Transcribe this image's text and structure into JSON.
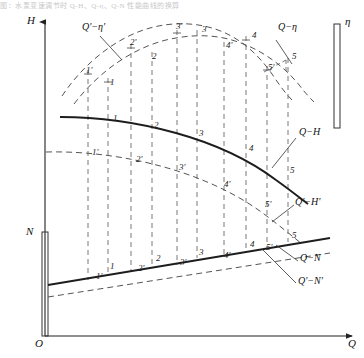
{
  "figure": {
    "title_strip": "图：水泵变速调节时 Q-H、Q-η、Q-N 性能曲线的换算",
    "background": "#ffffff",
    "line_color": "#222222",
    "dashed_color": "#5a5a5a"
  },
  "axes": {
    "y_head": {
      "label": "H",
      "name": "head-axis"
    },
    "y_efficiency": {
      "label": "η",
      "name": "efficiency-axis"
    },
    "y_power": {
      "label": "N",
      "name": "power-axis"
    },
    "x_flow": {
      "label": "Q",
      "name": "flow-axis"
    },
    "origin": {
      "label": "O"
    }
  },
  "curves": {
    "eta_original": {
      "label": "Q−η",
      "style": "dashed"
    },
    "eta_converted": {
      "label": "Q'−η'",
      "style": "dashed"
    },
    "head_original": {
      "label": "Q−H",
      "style": "solid"
    },
    "head_converted": {
      "label": "Q'−H'",
      "style": "dashed"
    },
    "power_original": {
      "label": "Q−N",
      "style": "solid"
    },
    "power_converted": {
      "label": "Q'−N'",
      "style": "dashed"
    }
  },
  "points": {
    "primary": [
      "1",
      "2",
      "3",
      "4",
      "5"
    ],
    "converted": [
      "1'",
      "2'",
      "3'",
      "4'",
      "5'"
    ]
  },
  "point_labels": {
    "eta_top": [
      {
        "text": "1'",
        "x": 86,
        "y": 66
      },
      {
        "text": "1",
        "x": 110,
        "y": 78
      },
      {
        "text": "2'",
        "x": 130,
        "y": 38
      },
      {
        "text": "2",
        "x": 152,
        "y": 52
      },
      {
        "text": "3'",
        "x": 176,
        "y": 22
      },
      {
        "text": "3",
        "x": 202,
        "y": 25
      },
      {
        "text": "4'",
        "x": 226,
        "y": 41
      },
      {
        "text": "4",
        "x": 252,
        "y": 31
      },
      {
        "text": "5'",
        "x": 268,
        "y": 63
      },
      {
        "text": "5",
        "x": 292,
        "y": 52
      }
    ],
    "head_mid": [
      {
        "text": "1",
        "x": 113,
        "y": 114
      },
      {
        "text": "2",
        "x": 154,
        "y": 121
      },
      {
        "text": "3",
        "x": 199,
        "y": 129
      },
      {
        "text": "4",
        "x": 249,
        "y": 144
      },
      {
        "text": "5",
        "x": 290,
        "y": 166
      },
      {
        "text": "1'",
        "x": 92,
        "y": 148
      },
      {
        "text": "2'",
        "x": 136,
        "y": 155
      },
      {
        "text": "3'",
        "x": 179,
        "y": 163
      },
      {
        "text": "4'",
        "x": 224,
        "y": 180
      },
      {
        "text": "5'",
        "x": 265,
        "y": 200
      }
    ],
    "power_bottom": [
      {
        "text": "1",
        "x": 110,
        "y": 262
      },
      {
        "text": "2",
        "x": 156,
        "y": 254
      },
      {
        "text": "3",
        "x": 199,
        "y": 248
      },
      {
        "text": "4",
        "x": 250,
        "y": 240
      },
      {
        "text": "5",
        "x": 292,
        "y": 231
      },
      {
        "text": "1'",
        "x": 96,
        "y": 272
      },
      {
        "text": "2'",
        "x": 138,
        "y": 264
      },
      {
        "text": "3'",
        "x": 180,
        "y": 258
      },
      {
        "text": "4'",
        "x": 224,
        "y": 251
      },
      {
        "text": "5'",
        "x": 266,
        "y": 243
      }
    ]
  },
  "curve_label_positions": {
    "eta_converted": {
      "x": 82,
      "y": 27
    },
    "eta_original": {
      "x": 278,
      "y": 27
    },
    "head_original": {
      "x": 299,
      "y": 132
    },
    "head_converted": {
      "x": 297,
      "y": 202
    },
    "power_original": {
      "x": 300,
      "y": 258
    },
    "power_converted": {
      "x": 298,
      "y": 280
    }
  }
}
